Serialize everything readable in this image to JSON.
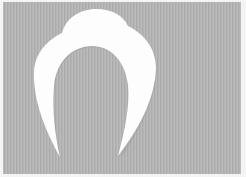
{
  "image": {
    "description": "White paper cutout shaped like an arch / horseshoe with a rounded dome on top, photographed on a gray vertically-ribbed background",
    "subject": "paper-arch-cutout"
  },
  "colors": {
    "background": "#b4b4b4",
    "border": "#f4f4f4",
    "shape": "#fdfdfd",
    "shape_shadow": "#9a9a9a"
  }
}
